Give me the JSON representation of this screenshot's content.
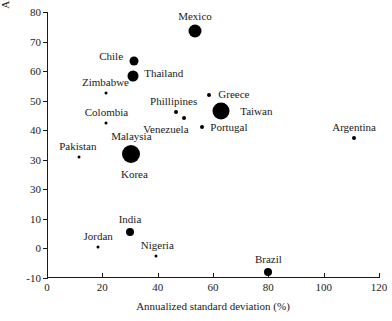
{
  "chart_data": {
    "type": "scatter",
    "title": "",
    "xlabel": "Annualized standard deviation (%)",
    "ylabel": "Annualized mean return (%)",
    "xlim": [
      0,
      120
    ],
    "ylim": [
      -10,
      80
    ],
    "xticks": [
      "0",
      "20",
      "40",
      "60",
      "80",
      "100",
      "120"
    ],
    "xtick_values": [
      0,
      20,
      40,
      60,
      80,
      100,
      120
    ],
    "yticks": [
      "80",
      "70",
      "60",
      "50",
      "40",
      "30",
      "30",
      "10",
      "0",
      "-10"
    ],
    "ytick_values": [
      80,
      70,
      60,
      50,
      40,
      30,
      20,
      10,
      0,
      -10
    ],
    "grid": false,
    "legend": "none",
    "marker_color": "#000000",
    "points": [
      {
        "name": "Mexico",
        "x": 53.5,
        "y": 73.5,
        "size": 13,
        "label_dx": 0,
        "label_dy": -15
      },
      {
        "name": "Chile",
        "x": 31.5,
        "y": 63.5,
        "size": 9,
        "label_dx": -23,
        "label_dy": -5
      },
      {
        "name": "Thailand",
        "x": 31.0,
        "y": 58.5,
        "size": 11,
        "label_dx": 31,
        "label_dy": -3
      },
      {
        "name": "Zimbabwe",
        "x": 21.5,
        "y": 52.5,
        "size": 3,
        "label_dx": -1,
        "label_dy": -11
      },
      {
        "name": "Greece",
        "x": 58.5,
        "y": 52.0,
        "size": 4,
        "label_dx": 25,
        "label_dy": -1
      },
      {
        "name": "Taiwan",
        "x": 63.0,
        "y": 46.5,
        "size": 17,
        "label_dx": 35,
        "label_dy": 0
      },
      {
        "name": "Phillipines",
        "x": 46.5,
        "y": 46.0,
        "size": 4,
        "label_dx": -2,
        "label_dy": -11
      },
      {
        "name": "Colombia",
        "x": 21.5,
        "y": 42.5,
        "size": 3,
        "label_dx": 0,
        "label_dy": -11
      },
      {
        "name": "Venezuela",
        "x": 49.5,
        "y": 44.0,
        "size": 4,
        "label_dx": -18,
        "label_dy": 11
      },
      {
        "name": "Portugal",
        "x": 56.0,
        "y": 41.0,
        "size": 4,
        "label_dx": 27,
        "label_dy": 0
      },
      {
        "name": "Argentina",
        "x": 111.0,
        "y": 37.5,
        "size": 4,
        "label_dx": 0,
        "label_dy": -11
      },
      {
        "name": "Malaysia",
        "x": 30.5,
        "y": 32.0,
        "size": 18,
        "label_dx": 0,
        "label_dy": -18
      },
      {
        "name": "Korea",
        "x": 30.5,
        "y": 32.0,
        "size": 0,
        "label_dx": 3,
        "label_dy": 20
      },
      {
        "name": "Pakistan",
        "x": 11.5,
        "y": 31.0,
        "size": 3,
        "label_dx": -1,
        "label_dy": -11
      },
      {
        "name": "India",
        "x": 30.0,
        "y": 5.5,
        "size": 8,
        "label_dx": 0,
        "label_dy": -13
      },
      {
        "name": "Jordan",
        "x": 18.5,
        "y": 0.5,
        "size": 3,
        "label_dx": 0,
        "label_dy": -11
      },
      {
        "name": "Nigeria",
        "x": 39.5,
        "y": -2.5,
        "size": 3,
        "label_dx": 1,
        "label_dy": -11
      },
      {
        "name": "Brazil",
        "x": 80.0,
        "y": -8.0,
        "size": 8,
        "label_dx": 0,
        "label_dy": -13
      }
    ]
  }
}
